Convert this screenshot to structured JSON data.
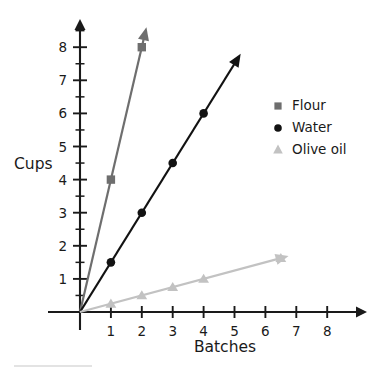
{
  "chart_data": {
    "type": "line",
    "title": "",
    "xlabel": "Batches",
    "ylabel": "Cups",
    "xlim": [
      0,
      8.6
    ],
    "ylim": [
      0,
      8.9
    ],
    "x_ticks": [
      1,
      2,
      3,
      4,
      5,
      6,
      7,
      8
    ],
    "y_ticks": [
      1,
      2,
      3,
      4,
      5,
      6,
      7,
      8
    ],
    "y_minor_ticks": [
      0.5,
      1.5,
      2.5,
      3.5,
      4.5,
      5.5,
      6.5,
      7.5,
      8.5
    ],
    "grid": false,
    "legend_position": "right",
    "series": [
      {
        "name": "Flour",
        "marker": "square",
        "color": "#6e6e6e",
        "slope": 4,
        "points": [
          [
            0,
            0
          ],
          [
            1,
            4
          ],
          [
            2,
            8
          ]
        ],
        "marker_points": [
          [
            1,
            4
          ],
          [
            2,
            8
          ]
        ],
        "arrow_tip": [
          2.15,
          8.6
        ]
      },
      {
        "name": "Water",
        "marker": "circle",
        "color": "#121212",
        "slope": 1.5,
        "points": [
          [
            0,
            0
          ],
          [
            1,
            1.5
          ],
          [
            2,
            3
          ],
          [
            3,
            4.5
          ],
          [
            4,
            6
          ]
        ],
        "marker_points": [
          [
            1,
            1.5
          ],
          [
            2,
            3
          ],
          [
            3,
            4.5
          ],
          [
            4,
            6
          ]
        ],
        "arrow_tip": [
          5.2,
          7.8
        ]
      },
      {
        "name": "Olive oil",
        "marker": "triangle",
        "color": "#c2c2c2",
        "slope": 0.25,
        "points": [
          [
            0,
            0
          ],
          [
            1,
            0.25
          ],
          [
            2,
            0.5
          ],
          [
            3,
            0.75
          ],
          [
            4,
            1
          ],
          [
            6.5,
            1.625
          ]
        ],
        "marker_points": [
          [
            1,
            0.25
          ],
          [
            2,
            0.5
          ],
          [
            3,
            0.75
          ],
          [
            4,
            1
          ],
          [
            6.5,
            1.625
          ]
        ],
        "arrow_tip": [
          6.75,
          1.69
        ]
      }
    ]
  },
  "axes": {
    "x_title": "Batches",
    "y_title": "Cups",
    "x_tick_labels": [
      "1",
      "2",
      "3",
      "4",
      "5",
      "6",
      "7",
      "8"
    ],
    "y_tick_labels": [
      "1",
      "2",
      "3",
      "4",
      "5",
      "6",
      "7",
      "8"
    ]
  },
  "legend": {
    "entries": [
      {
        "label": "Flour",
        "marker": "square-marker",
        "color": "#6e6e6e"
      },
      {
        "label": "Water",
        "marker": "circle-marker",
        "color": "#121212"
      },
      {
        "label": "Olive oil",
        "marker": "triangle-marker",
        "color": "#c2c2c2"
      }
    ]
  },
  "colors": {
    "flour": "#6e6e6e",
    "water": "#121212",
    "olive_oil": "#c2c2c2",
    "axis": "#1a1a1a",
    "background": "#ffffff",
    "bottom_rule": "#c8c8c8"
  }
}
